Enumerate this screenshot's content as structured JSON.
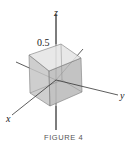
{
  "figure": {
    "caption": "FIGURE 4",
    "axes": {
      "x_label": "x",
      "y_label": "y",
      "z_label": "z"
    },
    "cube_edge_label": "0.5",
    "colors": {
      "cube_face": "#c8c8c8",
      "cube_face_dark": "#b4b4b4",
      "cube_top": "#e2e2e2",
      "edge": "#7a7a7a",
      "axis": "#333333"
    }
  }
}
